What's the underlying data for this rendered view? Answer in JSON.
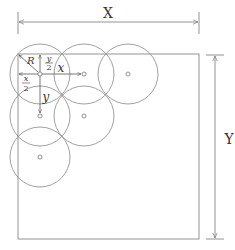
{
  "diagram": {
    "type": "circle-packing-layout",
    "colors": {
      "line": "#777777",
      "text": "#333333",
      "background": "#ffffff"
    },
    "dimensions": {
      "width_label": "X",
      "height_label": "Y"
    },
    "labels": {
      "radius": "R",
      "half_y_num": "y",
      "half_y_den": "2",
      "half_x_num": "x",
      "half_x_den": "2",
      "spacing_x": "x",
      "spacing_y": "y"
    },
    "rectangle": {
      "x": 18,
      "y": 54,
      "width": 181,
      "height": 185
    },
    "circle_radius": 30,
    "circles": [
      {
        "row": 1,
        "col": 1,
        "cx": 40,
        "cy": 74
      },
      {
        "row": 1,
        "col": 2,
        "cx": 84,
        "cy": 74
      },
      {
        "row": 1,
        "col": 3,
        "cx": 128,
        "cy": 74
      },
      {
        "row": 2,
        "col": 1,
        "cx": 40,
        "cy": 116
      },
      {
        "row": 2,
        "col": 2,
        "cx": 84,
        "cy": 116
      },
      {
        "row": 3,
        "col": 1,
        "cx": 40,
        "cy": 157
      }
    ]
  }
}
